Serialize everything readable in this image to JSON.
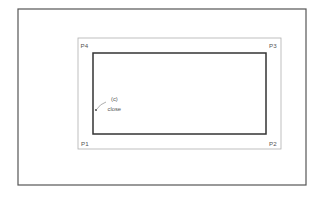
{
  "diagram": {
    "viewport": {
      "border_color": "#555555"
    },
    "selection_window": {
      "border_color": "#aaaaaa"
    },
    "rectangle": {
      "border_color": "#333333"
    },
    "corner_labels": {
      "p1": "P1",
      "p2": "P2",
      "p3": "P3",
      "p4": "P4"
    },
    "annotation": {
      "line1": "(c)",
      "line2": "close"
    }
  }
}
